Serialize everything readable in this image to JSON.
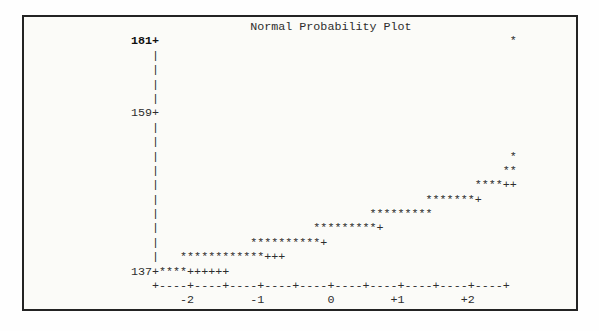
{
  "colors": {
    "outer": "#fefefe",
    "paper": "#fbfbf8",
    "border": "#232323",
    "ink": "#2d2d2d"
  },
  "plot": {
    "title": "Normal Probability Plot",
    "y_axis_labels": [
      "181",
      "159",
      "137"
    ],
    "x_axis_labels": [
      "-2",
      "-1",
      "0",
      "+1",
      "+2"
    ],
    "observed_marker": "*",
    "reference_marker": "+",
    "lines": [
      {
        "text": "                 Normal Probability Plot"
      },
      {
        "text": "181+                                                  *",
        "bold_chars": 4
      },
      {
        "text": "   |"
      },
      {
        "text": "   |"
      },
      {
        "text": "   |"
      },
      {
        "text": "   |"
      },
      {
        "text": "159+"
      },
      {
        "text": "   |"
      },
      {
        "text": "   |"
      },
      {
        "text": "   |                                                  *"
      },
      {
        "text": "   |                                                 **"
      },
      {
        "text": "   |                                             ****++"
      },
      {
        "text": "   |                                      *******+"
      },
      {
        "text": "   |                              *********"
      },
      {
        "text": "   |                      *********+"
      },
      {
        "text": "   |             **********+"
      },
      {
        "text": "   |   ************+++"
      },
      {
        "text": "137+****++++++"
      },
      {
        "text": "   +----+----+----+----+----+----+----+----+----+----+"
      },
      {
        "text": "       -2        -1         0        +1        +2"
      }
    ]
  },
  "chart_data": {
    "type": "scatter",
    "title": "Normal Probability Plot",
    "xlabel": "",
    "ylabel": "",
    "xlim": [
      -2.5,
      2.6
    ],
    "ylim": [
      137,
      181
    ],
    "x_tick_values": [
      -2,
      -1,
      0,
      1,
      2
    ],
    "x_tick_labels": [
      "-2",
      "-1",
      "0",
      "+1",
      "+2"
    ],
    "y_tick_values": [
      137,
      159,
      181
    ],
    "y_tick_labels": [
      "137",
      "159",
      "181"
    ],
    "grid": false,
    "legend": "none",
    "y_values_estimated": true,
    "series": [
      {
        "name": "observed",
        "marker": "*",
        "rows": [
          {
            "y": 181,
            "x": [
              2.6
            ]
          },
          {
            "y": 153,
            "x": [
              2.6
            ]
          },
          {
            "y": 151,
            "x": [
              2.5,
              2.6
            ]
          },
          {
            "y": 149,
            "x": [
              2.1,
              2.2,
              2.3,
              2.4
            ]
          },
          {
            "y": 147,
            "x": [
              1.4,
              1.5,
              1.6,
              1.7,
              1.8,
              1.9,
              2.0
            ]
          },
          {
            "y": 145,
            "x": [
              0.6,
              0.7,
              0.8,
              0.9,
              1.0,
              1.1,
              1.2,
              1.3,
              1.4
            ]
          },
          {
            "y": 143,
            "x": [
              -0.2,
              -0.1,
              0.0,
              0.1,
              0.2,
              0.3,
              0.4,
              0.5,
              0.6
            ]
          },
          {
            "y": 141,
            "x": [
              -1.1,
              -1.0,
              -0.9,
              -0.8,
              -0.7,
              -0.6,
              -0.5,
              -0.4,
              -0.3,
              -0.2
            ]
          },
          {
            "y": 139,
            "x": [
              -2.1,
              -2.0,
              -1.9,
              -1.8,
              -1.7,
              -1.6,
              -1.5,
              -1.4,
              -1.3,
              -1.2,
              -1.1,
              -1.0
            ]
          },
          {
            "y": 137,
            "x": [
              -2.4,
              -2.3,
              -2.2,
              -2.1
            ]
          }
        ]
      },
      {
        "name": "reference",
        "marker": "+",
        "rows": [
          {
            "y": 149,
            "x": [
              2.5,
              2.6
            ]
          },
          {
            "y": 147,
            "x": [
              2.1
            ]
          },
          {
            "y": 143,
            "x": [
              0.7
            ]
          },
          {
            "y": 141,
            "x": [
              -0.1
            ]
          },
          {
            "y": 139,
            "x": [
              -0.9,
              -0.8,
              -0.7
            ]
          },
          {
            "y": 137,
            "x": [
              -2.0,
              -1.9,
              -1.8,
              -1.7,
              -1.6,
              -1.5
            ]
          }
        ]
      }
    ]
  }
}
